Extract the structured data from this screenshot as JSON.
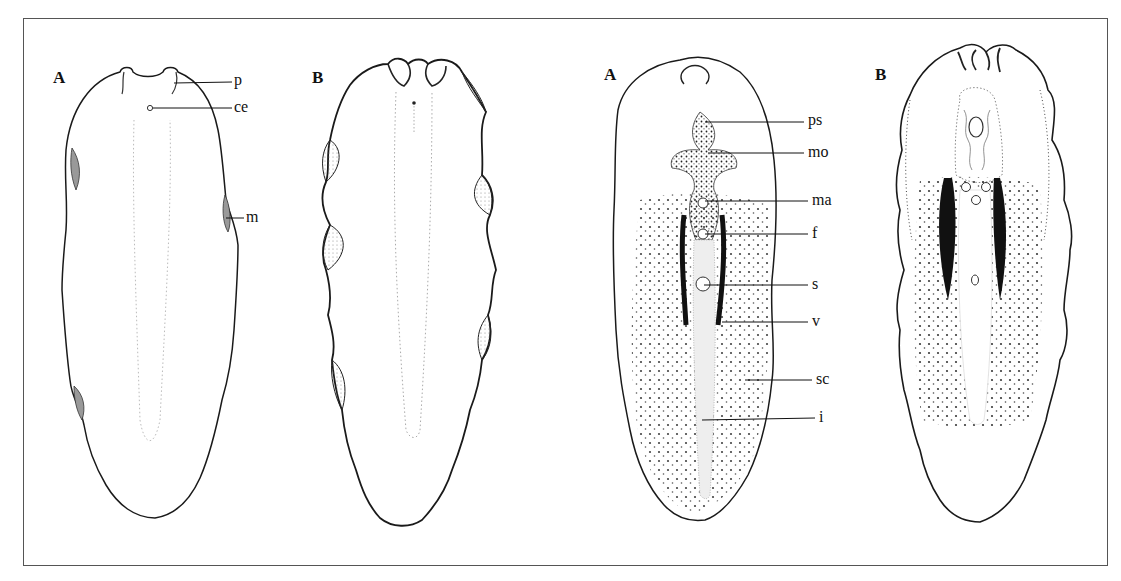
{
  "figure": {
    "panels": [
      {
        "id": "left-A",
        "label": "A"
      },
      {
        "id": "left-B",
        "label": "B"
      },
      {
        "id": "right-A",
        "label": "A"
      },
      {
        "id": "right-B",
        "label": "B"
      }
    ],
    "labels": {
      "left_A": [
        {
          "key": "p",
          "text": "p"
        },
        {
          "key": "ce",
          "text": "ce"
        },
        {
          "key": "m",
          "text": "m"
        }
      ],
      "right_A": [
        {
          "key": "ps",
          "text": "ps"
        },
        {
          "key": "mo",
          "text": "mo"
        },
        {
          "key": "ma",
          "text": "ma"
        },
        {
          "key": "f",
          "text": "f"
        },
        {
          "key": "s",
          "text": "s"
        },
        {
          "key": "v",
          "text": "v"
        },
        {
          "key": "sc",
          "text": "sc"
        },
        {
          "key": "i",
          "text": "i"
        }
      ]
    },
    "colors": {
      "ink": "#1a1a1a",
      "frame": "#555555",
      "stipple": "#222222",
      "background": "#ffffff"
    }
  }
}
